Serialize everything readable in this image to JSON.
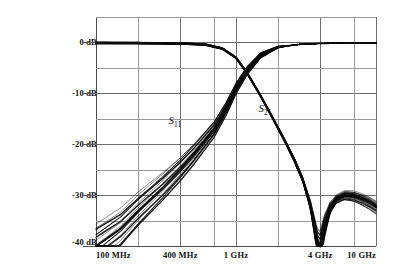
{
  "chart_data": {
    "type": "line",
    "title": "",
    "xlabel": "",
    "ylabel": "",
    "xscale": "log",
    "yscale": "linear",
    "xlim": [
      100,
      10000
    ],
    "ylim": [
      -40,
      5
    ],
    "grid": true,
    "legend_position": "inline-annotation",
    "x_unit": "MHz",
    "y_unit": "dB",
    "xticks": [
      {
        "value": 100,
        "label": "100 MHz"
      },
      {
        "value": 400,
        "label": "400 MHz"
      },
      {
        "value": 1000,
        "label": "1 GHz"
      },
      {
        "value": 4000,
        "label": "4 GHz"
      },
      {
        "value": 10000,
        "label": "10 GHz"
      }
    ],
    "yticks": [
      {
        "value": 0,
        "label": "0 dB"
      },
      {
        "value": -10,
        "label": "-10 dB"
      },
      {
        "value": -20,
        "label": "-20 dB"
      },
      {
        "value": -30,
        "label": "-30 dB"
      },
      {
        "value": -40,
        "label": "-40 dB"
      }
    ],
    "y_minor_ticks": [
      -5,
      -15,
      -25,
      -35
    ],
    "y_top_gridline": 5,
    "x_minor_gridlines": [
      200,
      400,
      700,
      1000,
      2000,
      4000,
      7000
    ],
    "annotations": [
      {
        "text": "S",
        "sub": "11",
        "x": 330,
        "y": -15.5,
        "name": "s11-curve-label"
      },
      {
        "text": "S",
        "sub": "21",
        "x": 1450,
        "y": -13.0,
        "name": "s21-curve-label"
      }
    ],
    "series": [
      {
        "name": "S11",
        "description": "input return loss, many overlaid measurement traces",
        "trace_count": 24,
        "points": [
          {
            "x": 100,
            "y": -40.0
          },
          {
            "x": 150,
            "y": -36.5
          },
          {
            "x": 200,
            "y": -33.0
          },
          {
            "x": 300,
            "y": -28.5
          },
          {
            "x": 400,
            "y": -25.0
          },
          {
            "x": 500,
            "y": -22.0
          },
          {
            "x": 700,
            "y": -17.0
          },
          {
            "x": 850,
            "y": -13.0
          },
          {
            "x": 1000,
            "y": -9.0
          },
          {
            "x": 1200,
            "y": -5.5
          },
          {
            "x": 1500,
            "y": -2.5
          },
          {
            "x": 2000,
            "y": -0.9
          },
          {
            "x": 3000,
            "y": -0.3
          },
          {
            "x": 4000,
            "y": -0.2
          },
          {
            "x": 6000,
            "y": -0.15
          },
          {
            "x": 10000,
            "y": -0.1
          }
        ],
        "spread_db": 4.5
      },
      {
        "name": "S21",
        "description": "forward transmission, lowpass with deep null near 4 GHz",
        "trace_count": 24,
        "points": [
          {
            "x": 100,
            "y": -0.1
          },
          {
            "x": 200,
            "y": -0.12
          },
          {
            "x": 400,
            "y": -0.2
          },
          {
            "x": 600,
            "y": -0.4
          },
          {
            "x": 800,
            "y": -1.2
          },
          {
            "x": 1000,
            "y": -3.0
          },
          {
            "x": 1200,
            "y": -6.0
          },
          {
            "x": 1500,
            "y": -10.5
          },
          {
            "x": 1800,
            "y": -14.5
          },
          {
            "x": 2200,
            "y": -19.0
          },
          {
            "x": 2600,
            "y": -23.0
          },
          {
            "x": 3000,
            "y": -27.0
          },
          {
            "x": 3400,
            "y": -32.0
          },
          {
            "x": 3800,
            "y": -39.0
          },
          {
            "x": 4000,
            "y": -40.0
          },
          {
            "x": 4300,
            "y": -36.0
          },
          {
            "x": 4700,
            "y": -32.5
          },
          {
            "x": 5200,
            "y": -30.8
          },
          {
            "x": 6000,
            "y": -30.0
          },
          {
            "x": 7000,
            "y": -30.2
          },
          {
            "x": 8000,
            "y": -30.8
          },
          {
            "x": 9000,
            "y": -31.5
          },
          {
            "x": 10000,
            "y": -32.3
          }
        ],
        "spread_db": 1.2
      }
    ]
  },
  "colors": {
    "trace": "#0a0a0a",
    "grid_minor": "#9a9a9a",
    "grid_major": "#6e6e6e",
    "axis": "#4a4a4a",
    "background": "#ffffff",
    "text": "#111111"
  }
}
